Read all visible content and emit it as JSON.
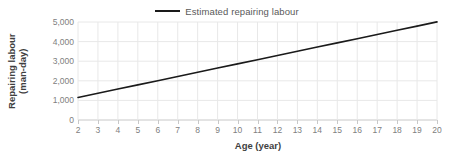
{
  "chart_data": {
    "type": "line",
    "title": "",
    "xlabel": "Age (year)",
    "ylabel": "Repairing labour\n(man-day)",
    "ylabel_line1": "Repairing labour",
    "ylabel_line2": "(man-day)",
    "xlim": [
      2,
      20
    ],
    "ylim": [
      0,
      5000
    ],
    "xticks": [
      2,
      3,
      4,
      5,
      6,
      7,
      8,
      9,
      10,
      11,
      12,
      13,
      14,
      15,
      16,
      17,
      18,
      19,
      20
    ],
    "xtick_labels": [
      "2",
      "3",
      "4",
      "5",
      "6",
      "7",
      "8",
      "9",
      "10",
      "11",
      "12",
      "13",
      "14",
      "15",
      "16",
      "17",
      "18",
      "19",
      "20"
    ],
    "yticks": [
      0,
      1000,
      2000,
      3000,
      4000,
      5000
    ],
    "ytick_labels": [
      "0",
      "1,000",
      "2,000",
      "3,000",
      "4,000",
      "5,000"
    ],
    "grid": true,
    "grid_color": "#e8e8e8",
    "legend_position": "top-center",
    "series": [
      {
        "name": "Estimated repairing labour",
        "color": "#1a1a1a",
        "line_width": 1.6,
        "x": [
          2,
          3,
          4,
          5,
          6,
          7,
          8,
          9,
          10,
          11,
          12,
          13,
          14,
          15,
          16,
          17,
          18,
          19,
          20
        ],
        "values": [
          1150,
          1364,
          1578,
          1792,
          2006,
          2221,
          2435,
          2649,
          2863,
          3077,
          3291,
          3506,
          3720,
          3934,
          4148,
          4362,
          4576,
          4791,
          5005
        ]
      }
    ]
  },
  "legend": {
    "entries": [
      {
        "label": "Estimated repairing labour",
        "color": "#1a1a1a"
      }
    ]
  },
  "axes": {
    "x_title": "Age (year)",
    "y_title_line1": "Repairing labour",
    "y_title_line2": "(man-day)"
  },
  "colors": {
    "series": "#1a1a1a",
    "grid": "#e8e8e8",
    "tick_text": "#808080",
    "axis_title_text": "#3f3f3f",
    "legend_text": "#595959",
    "background": "#ffffff"
  }
}
